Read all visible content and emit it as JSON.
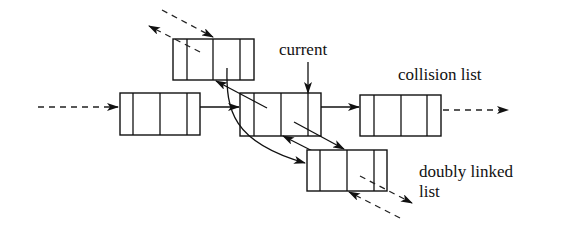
{
  "diagram": {
    "type": "linked-list-structure",
    "labels": {
      "current": "current",
      "collision_list": "collision list",
      "doubly_linked_line1": "doubly linked",
      "doubly_linked_line2": "list"
    },
    "nodes": [
      {
        "id": "node-left",
        "role": "collision list predecessor",
        "cells": 4
      },
      {
        "id": "node-top",
        "role": "doubly linked previous",
        "cells": 4
      },
      {
        "id": "node-current",
        "role": "current",
        "cells": 4
      },
      {
        "id": "node-right",
        "role": "collision list successor",
        "cells": 4
      },
      {
        "id": "node-bottom",
        "role": "doubly linked next",
        "cells": 4
      }
    ],
    "edges": [
      {
        "from": "incoming",
        "to": "node-left",
        "style": "dashed"
      },
      {
        "from": "node-left",
        "to": "node-current",
        "style": "solid"
      },
      {
        "from": "node-current",
        "to": "node-right",
        "style": "solid"
      },
      {
        "from": "node-right",
        "to": "outgoing",
        "style": "dashed"
      },
      {
        "from": "node-current",
        "to": "node-top",
        "style": "solid"
      },
      {
        "from": "node-top",
        "to": "node-bottom",
        "style": "solid-curved"
      },
      {
        "from": "node-current",
        "to": "node-bottom",
        "style": "solid"
      },
      {
        "from": "node-bottom",
        "to": "node-current",
        "style": "solid"
      },
      {
        "from": "node-top",
        "to": "upper-left",
        "style": "dashed"
      },
      {
        "from": "upper-left",
        "to": "node-top",
        "style": "dashed"
      },
      {
        "from": "node-bottom",
        "to": "lower-right",
        "style": "dashed"
      },
      {
        "from": "lower-right",
        "to": "node-bottom",
        "style": "dashed"
      }
    ],
    "colors": {
      "ink": "#111111",
      "background": "#ffffff"
    }
  }
}
